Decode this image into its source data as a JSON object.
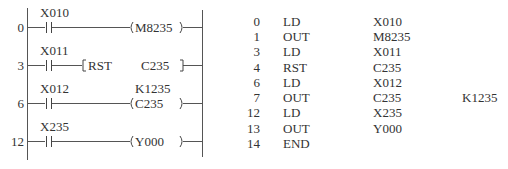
{
  "ladder": {
    "rungs": [
      {
        "step": "0",
        "contact": "X010",
        "instruction": "",
        "output": "M8235",
        "constant": "",
        "type": "coil"
      },
      {
        "step": "3",
        "contact": "X011",
        "instruction": "RST",
        "output": "C235",
        "constant": "",
        "type": "box"
      },
      {
        "step": "6",
        "contact": "X012",
        "instruction": "",
        "output": "C235",
        "constant": "K1235",
        "type": "coil"
      },
      {
        "step": "12",
        "contact": "X235",
        "instruction": "",
        "output": "Y000",
        "constant": "",
        "type": "coil"
      }
    ]
  },
  "instruction_list": {
    "rows": [
      {
        "step": "0",
        "op": "LD",
        "operand": "X010",
        "extra": ""
      },
      {
        "step": "1",
        "op": "OUT",
        "operand": "M8235",
        "extra": ""
      },
      {
        "step": "3",
        "op": "LD",
        "operand": "X011",
        "extra": ""
      },
      {
        "step": "4",
        "op": "RST",
        "operand": "C235",
        "extra": ""
      },
      {
        "step": "6",
        "op": "LD",
        "operand": "X012",
        "extra": ""
      },
      {
        "step": "7",
        "op": "OUT",
        "operand": "C235",
        "extra": "K1235"
      },
      {
        "step": "12",
        "op": "LD",
        "operand": "X235",
        "extra": ""
      },
      {
        "step": "13",
        "op": "OUT",
        "operand": "Y000",
        "extra": ""
      },
      {
        "step": "14",
        "op": "END",
        "operand": "",
        "extra": ""
      }
    ]
  }
}
